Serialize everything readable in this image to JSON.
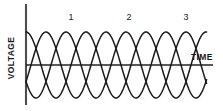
{
  "figure": {
    "title": "",
    "axes": {
      "y_label": "VOLTAGE",
      "x_label": "TIME"
    },
    "phase_labels": [
      {
        "text": "1",
        "x": 64,
        "y": 13
      },
      {
        "text": "2",
        "x": 122,
        "y": 13
      },
      {
        "text": "3",
        "x": 179,
        "y": 13
      }
    ],
    "colors": {
      "curve": "#1a1a1a",
      "axis": "#4d4d4d",
      "background": "#ffffff",
      "text": "#1a1a1a"
    }
  },
  "chart_data": {
    "type": "line",
    "xlabel": "TIME",
    "ylabel": "VOLTAGE",
    "grid": false,
    "legend": "none",
    "annotations": [
      "1",
      "2",
      "3"
    ],
    "xlim": [
      0,
      3.0
    ],
    "ylim": [
      -1,
      1
    ],
    "x_unit": "cycles",
    "geometry": {
      "origin_x_px": 26,
      "zero_line_y_px": 65,
      "amplitude_px": 33,
      "period_px": 60,
      "curve_start_x_px": 26,
      "curve_end_x_px": 207,
      "axis_x_top_px": 4,
      "axis_x_bottom_px": 105,
      "time_axis_end_x_px": 213
    },
    "series": [
      {
        "name": "Phase 1",
        "phase_deg": 90,
        "amplitude": 1,
        "cycles": 3
      },
      {
        "name": "Phase 2",
        "phase_deg": -30,
        "amplitude": 1,
        "cycles": 3
      },
      {
        "name": "Phase 3",
        "phase_deg": 210,
        "amplitude": 1,
        "cycles": 3
      }
    ],
    "sampled_points": {
      "x": [
        0,
        0.125,
        0.25,
        0.375,
        0.5,
        0.625,
        0.75,
        0.875,
        1.0,
        1.25,
        1.5,
        1.75,
        2.0,
        2.25,
        2.5,
        2.75,
        3.0
      ],
      "Phase 1": [
        1.0,
        0.707,
        0.0,
        -0.707,
        -1.0,
        -0.707,
        0.0,
        0.707,
        1.0,
        0.0,
        -1.0,
        0.0,
        1.0,
        0.0,
        -1.0,
        0.0,
        1.0
      ],
      "Phase 2": [
        -0.5,
        0.259,
        0.866,
        0.966,
        0.5,
        -0.259,
        -0.866,
        -0.966,
        -0.5,
        0.866,
        0.5,
        -0.866,
        -0.5,
        0.866,
        0.5,
        -0.866,
        -0.5
      ],
      "Phase 3": [
        -0.5,
        -0.966,
        -0.866,
        -0.259,
        0.5,
        0.966,
        0.866,
        0.259,
        -0.5,
        -0.866,
        0.5,
        0.866,
        -0.5,
        -0.866,
        0.5,
        0.866,
        -0.5
      ]
    }
  }
}
